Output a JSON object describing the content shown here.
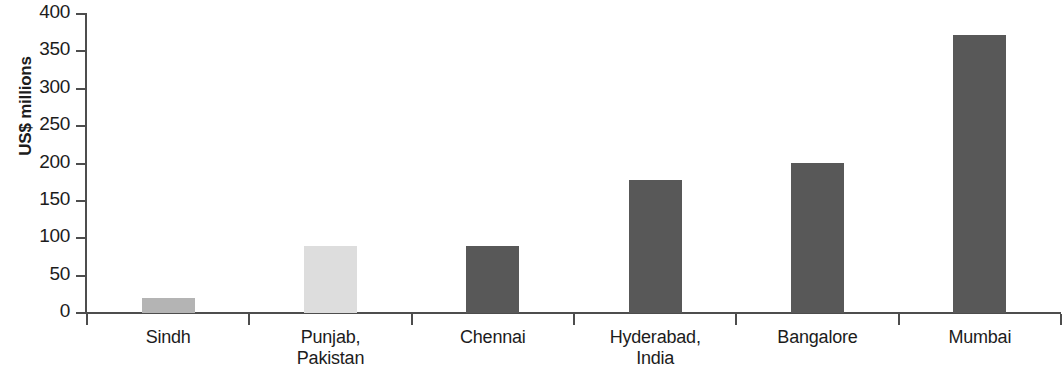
{
  "chart_data": {
    "type": "bar",
    "title": "",
    "xlabel": "",
    "ylabel": "US$ millions",
    "ylim": [
      0,
      400
    ],
    "yticks": [
      0,
      50,
      100,
      150,
      200,
      250,
      300,
      350,
      400
    ],
    "ytick_labels": [
      "0",
      "50",
      "100",
      "150",
      "200",
      "250",
      "300",
      "350",
      "400"
    ],
    "grid": false,
    "legend": "none",
    "categories": [
      "Sindh",
      "Punjab, Pakistan",
      "Chennai",
      "Hyderabad, India",
      "Bangalore",
      "Mumbai"
    ],
    "category_lines": [
      [
        "Sindh"
      ],
      [
        "Punjab,",
        "Pakistan"
      ],
      [
        "Chennai"
      ],
      [
        "Hyderabad,",
        "India"
      ],
      [
        "Bangalore"
      ],
      [
        "Mumbai"
      ]
    ],
    "values": [
      20,
      89,
      90,
      178,
      201,
      372
    ],
    "bar_colors": [
      "#b4b4b4",
      "#dddddd",
      "#585858",
      "#585858",
      "#585858",
      "#585858"
    ],
    "colors": {
      "axis": "#4d4d4d",
      "text": "#1c1c1c",
      "background": "#ffffff",
      "bar_dark": "#585858",
      "bar_medium": "#b4b4b4",
      "bar_light": "#dddddd"
    }
  }
}
